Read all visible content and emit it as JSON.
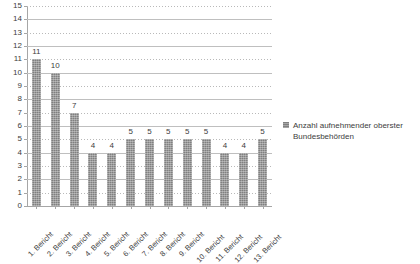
{
  "chart_data": {
    "type": "bar",
    "title": "",
    "subtitle": "",
    "xlabel": "",
    "ylabel": "",
    "ylim": [
      0,
      15
    ],
    "ytick_step": 1,
    "grid": true,
    "legend_position": "right",
    "series_color": "#808080",
    "categories": [
      "1. Bericht",
      "2. Bericht",
      "3. Bericht",
      "4. Bericht",
      "5. Bericht",
      "6. Bericht",
      "7. Bericht",
      "8. Bericht",
      "9. Bericht",
      "10. Bericht",
      "11. Bericht",
      "12. Bericht",
      "13. Bericht"
    ],
    "values": [
      11,
      10,
      7,
      4,
      4,
      5,
      5,
      5,
      5,
      5,
      4,
      4,
      5
    ],
    "data_labels": [
      "11",
      "10",
      "7",
      "4",
      "4",
      "5",
      "5",
      "5",
      "5",
      "5",
      "4",
      "4",
      "5"
    ],
    "yticks": [
      "15",
      "14",
      "13",
      "12",
      "11",
      "10",
      "9",
      "8",
      "7",
      "6",
      "5",
      "4",
      "3",
      "2",
      "1",
      "0"
    ],
    "series": [
      {
        "name": "Anzahl aufnehmender oberster Bundesbehörden",
        "values": [
          11,
          10,
          7,
          4,
          4,
          5,
          5,
          5,
          5,
          5,
          4,
          4,
          5
        ]
      }
    ],
    "legend": [
      {
        "label": "Anzahl aufnehmender oberster Bundesbehörden",
        "color": "#808080"
      }
    ]
  },
  "legend": {
    "entry_label": "Anzahl aufnehmender oberster Bundesbehörden"
  }
}
